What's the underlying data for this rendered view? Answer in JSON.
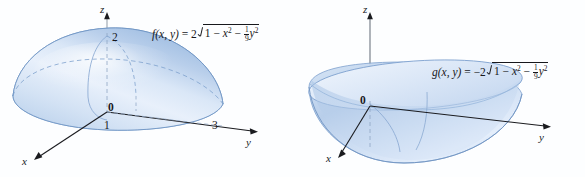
{
  "figure": {
    "kind": "3d-surface-plot-pair",
    "background_color": "#fdfeff",
    "surface_fill_light": "#eaf1fb",
    "surface_fill_mid": "#c3d6ef",
    "surface_fill_dark": "#8fb2da",
    "surface_edge_color": "#6f95c4",
    "axis_color": "#1a1b1f",
    "text_color": "#17181c"
  },
  "panels": [
    {
      "id": "left",
      "name": "upper-hemiellipsoid",
      "formula": {
        "fn": "f",
        "args": "(x, y)",
        "equals": "=",
        "coefficient": "2",
        "radicand_one": "1",
        "minus_1": "−",
        "x_term": "x",
        "x_power": "2",
        "minus_2": "−",
        "frac_num": "1",
        "frac_den": "9",
        "y_term": "y",
        "y_power": "2"
      },
      "axes": [
        {
          "name": "z-axis",
          "label": "z"
        },
        {
          "name": "y-axis",
          "label": "y"
        },
        {
          "name": "x-axis",
          "label": "x"
        }
      ],
      "ticks": [
        {
          "name": "z-tick-2",
          "label": "2"
        },
        {
          "name": "origin",
          "label": "0"
        },
        {
          "name": "x-tick-1",
          "label": "1"
        },
        {
          "name": "y-tick-3",
          "label": "3"
        }
      ]
    },
    {
      "id": "right",
      "name": "lower-hemiellipsoid",
      "formula": {
        "fn": "g",
        "args": "(x, y)",
        "equals": "=",
        "coefficient": "−2",
        "radicand_one": "1",
        "minus_1": "−",
        "x_term": "x",
        "x_power": "2",
        "minus_2": "−",
        "frac_num": "1",
        "frac_den": "9",
        "y_term": "y",
        "y_power": "2"
      },
      "axes": [
        {
          "name": "z-axis",
          "label": "z"
        },
        {
          "name": "y-axis",
          "label": "y"
        },
        {
          "name": "x-axis",
          "label": "x"
        }
      ],
      "ticks": [
        {
          "name": "origin",
          "label": "0"
        }
      ]
    }
  ]
}
